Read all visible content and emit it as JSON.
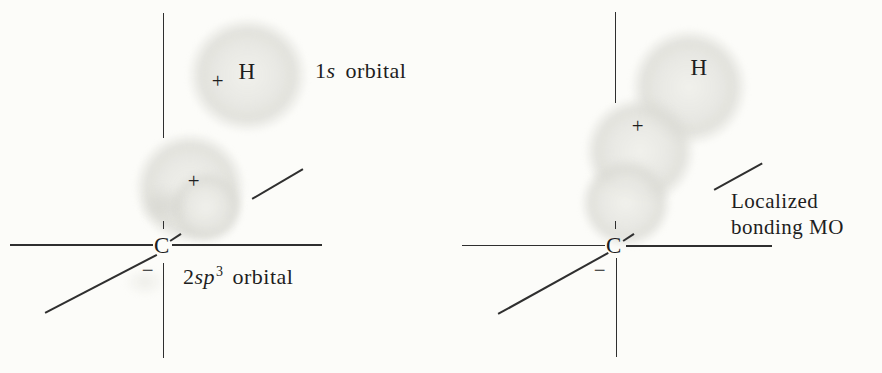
{
  "figure": {
    "background": "#fcfcf9",
    "ink": "#2f2f2f",
    "orbital_fill": "#e7e7e2"
  },
  "left_panel": {
    "carbon": "C",
    "hydrogen": "H",
    "plus_1s": "+",
    "plus_sp3": "+",
    "minus": "−",
    "label_1s": {
      "num": "1",
      "sym": "s",
      "rest": "orbital"
    },
    "label_sp3": {
      "num": "2",
      "sym": "sp",
      "sup": "3",
      "rest": "orbital"
    }
  },
  "right_panel": {
    "carbon": "C",
    "hydrogen": "H",
    "plus": "+",
    "minus": "−",
    "label_mo_line1": "Localized",
    "label_mo_line2": "bonding MO"
  }
}
